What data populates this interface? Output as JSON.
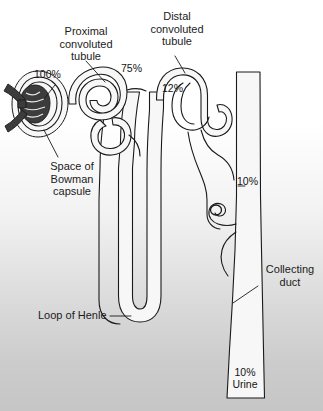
{
  "figure": {
    "background_top_color": "#ffffff",
    "background_bottom_color": "#c6c6c6",
    "outline_color": "#1a1a1a",
    "tubule_fill_color": "#f6f6f6",
    "glomerulus_color": "#3a3a3a"
  },
  "labels": {
    "proximal_convoluted_tubule": "Proximal\nconvoluted\ntubule",
    "distal_convoluted_tubule": "Distal\nconvoluted\ntubule",
    "space_of_bowman_capsule": "Space of\nBowman\ncapsule",
    "loop_of_henle": "Loop of Henle",
    "collecting_duct": "Collecting\nduct"
  },
  "percentages": {
    "glomerular_filtrate": "100%",
    "after_proximal_tubule": "75%",
    "after_loop_of_henle": "12%",
    "collecting_duct_entry": "10%",
    "urine": "10%\nUrine"
  }
}
